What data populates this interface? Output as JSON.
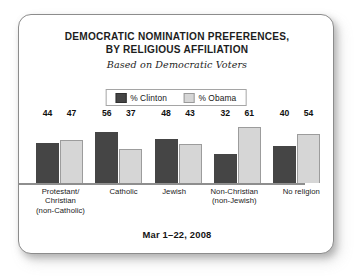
{
  "card": {
    "title_lines": [
      "DEMOCRATIC NOMINATION PREFERENCES,",
      "BY RELIGIOUS AFFILIATION"
    ],
    "subtitle": "Based on Democratic Voters",
    "footer": "Mar 1–22, 2008"
  },
  "legend": {
    "items": [
      {
        "label": "% Clinton",
        "swatch": "clinton-swatch",
        "color": "#454545"
      },
      {
        "label": "% Obama",
        "swatch": "obama-swatch",
        "color": "#d6d6d6"
      }
    ]
  },
  "chart_data": {
    "type": "bar",
    "title": "DEMOCRATIC NOMINATION PREFERENCES, BY RELIGIOUS AFFILIATION",
    "subtitle": "Based on Democratic Voters",
    "note": "Mar 1–22, 2008",
    "xlabel": "",
    "ylabel": "",
    "ylim": [
      0,
      70
    ],
    "grid": false,
    "legend_position": "top-center",
    "categories": [
      "Protestant/ Christian (non-Catholic)",
      "Catholic",
      "Jewish",
      "Non-Christian (non-Jewish)",
      "No religion"
    ],
    "category_lines": [
      [
        "Protestant/",
        "Christian",
        "(non-Catholic)"
      ],
      [
        "Catholic"
      ],
      [
        "Jewish"
      ],
      [
        "Non-Christian",
        "(non-Jewish)"
      ],
      [
        "No religion"
      ]
    ],
    "series": [
      {
        "name": "% Clinton",
        "color": "#454545",
        "values": [
          44,
          56,
          48,
          32,
          40
        ]
      },
      {
        "name": "% Obama",
        "color": "#d6d6d6",
        "values": [
          47,
          37,
          43,
          61,
          54
        ]
      }
    ]
  }
}
